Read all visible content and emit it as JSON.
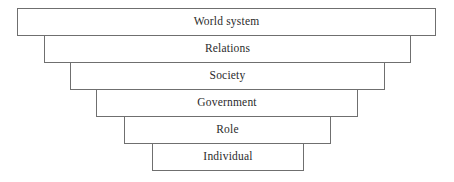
{
  "diagram": {
    "type": "inverted-pyramid-layer-diagram",
    "orientation": "vertical-stack-narrowing-downward",
    "background_color": "#ffffff",
    "border_color": "#6f6f6f",
    "text_color": "#2b2b2b",
    "layers": [
      {
        "label": "World system",
        "level": 1,
        "left": 17,
        "top": 8,
        "width": 419,
        "height": 28
      },
      {
        "label": "Relations",
        "level": 2,
        "left": 44,
        "top": 35,
        "width": 367,
        "height": 28
      },
      {
        "label": "Society",
        "level": 3,
        "left": 70,
        "top": 62,
        "width": 315,
        "height": 28
      },
      {
        "label": "Government",
        "level": 4,
        "top": 89,
        "left": 96,
        "width": 262,
        "height": 28
      },
      {
        "label": "Role",
        "level": 5,
        "left": 124,
        "top": 116,
        "width": 207,
        "height": 28
      },
      {
        "label": "Individual",
        "level": 6,
        "left": 152,
        "top": 143,
        "width": 152,
        "height": 28
      }
    ]
  }
}
